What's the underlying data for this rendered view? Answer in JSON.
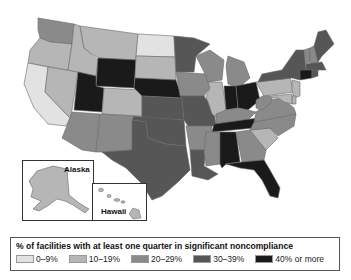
{
  "legend": {
    "title": "% of facilities with at least one quarter in significant noncompliance",
    "items": [
      {
        "label": "0–9%",
        "color": "#e2e2e2"
      },
      {
        "label": "10–19%",
        "color": "#b6b6b6"
      },
      {
        "label": "20–29%",
        "color": "#8a8a8a"
      },
      {
        "label": "30–39%",
        "color": "#565656"
      },
      {
        "label": "40% or more",
        "color": "#1a1a1a"
      }
    ]
  },
  "insets": {
    "alaska_label": "Alaska",
    "hawaii_label": "Hawaii"
  },
  "states": {
    "WA": "20–29%",
    "OR": "10–19%",
    "CA": "0–9%",
    "NV": "10–19%",
    "ID": "10–19%",
    "MT": "10–19%",
    "WY": "40% or more",
    "UT": "40% or more",
    "AZ": "20–29%",
    "CO": "10–19%",
    "NM": "20–29%",
    "ND": "0–9%",
    "SD": "10–19%",
    "NE": "40% or more",
    "KS": "30–39%",
    "OK": "30–39%",
    "TX": "30–39%",
    "MN": "30–39%",
    "IA": "20–29%",
    "MO": "30–39%",
    "AR": "20–29%",
    "LA": "30–39%",
    "WI": "20–29%",
    "IL": "10–19%",
    "MI": "20–29%",
    "IN": "40% or more",
    "OH": "40% or more",
    "KY": "20–29%",
    "TN": "40% or more",
    "MS": "20–29%",
    "AL": "40% or more",
    "GA": "20–29%",
    "FL": "40% or more",
    "SC": "10–19%",
    "NC": "20–29%",
    "VA": "20–29%",
    "WV": "20–29%",
    "PA": "10–19%",
    "NY": "30–39%",
    "VT": "20–29%",
    "NH": "20–29%",
    "ME": "30–39%",
    "MA": "30–39%",
    "CT": "40% or more",
    "RI": "30–39%",
    "NJ": "10–19%",
    "DE": "10–19%",
    "MD": "10–19%",
    "AK": "10–19%",
    "HI": "10–19%"
  }
}
